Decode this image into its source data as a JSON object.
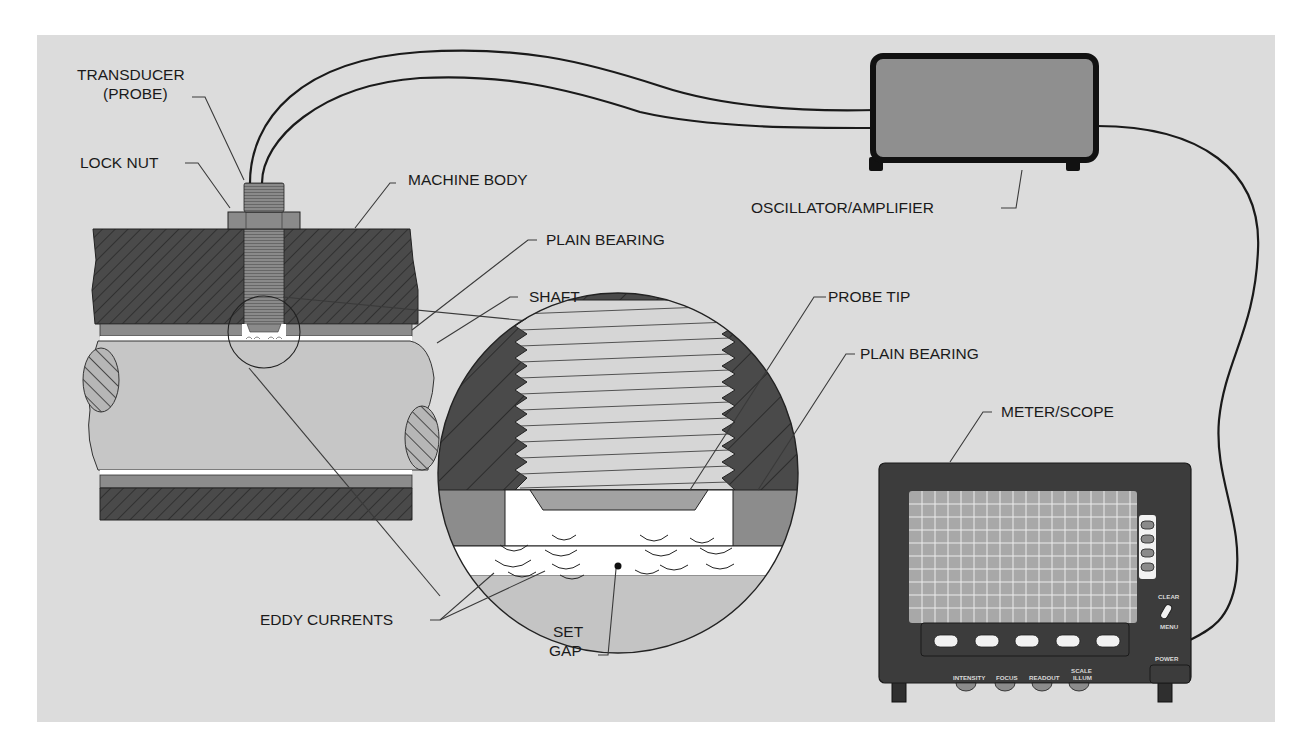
{
  "figure": {
    "colors": {
      "background_panel": "#dcdcdc",
      "machine_body": "#4a4a4a",
      "bearing": "#8c8c8c",
      "shaft": "#c4c4c4",
      "probe": "#8a8a8a",
      "oscillator_fill": "#8f8f8f",
      "scope_body": "#3c3c3c",
      "scope_screen": "#a8a8a8",
      "gap_white": "#ffffff"
    }
  },
  "labels": {
    "transducer_line1": "TRANSDUCER",
    "transducer_line2": "(PROBE)",
    "lock_nut": "LOCK NUT",
    "machine_body": "MACHINE BODY",
    "plain_bearing_top": "PLAIN BEARING",
    "shaft": "SHAFT",
    "probe_tip": "PROBE TIP",
    "plain_bearing_detail": "PLAIN BEARING",
    "oscillator_amplifier": "OSCILLATOR/AMPLIFIER",
    "meter_scope": "METER/SCOPE",
    "eddy_currents": "EDDY CURRENTS",
    "set_gap_line1": "SET",
    "set_gap_line2": "GAP"
  },
  "scope": {
    "clear": "CLEAR",
    "menu": "MENU",
    "power": "POWER",
    "knobs": [
      "INTENSITY",
      "FOCUS",
      "READOUT",
      "SCALE"
    ],
    "knob4_line2": "ILLUM",
    "soft_keys_bottom": 5,
    "soft_keys_side": 4
  }
}
